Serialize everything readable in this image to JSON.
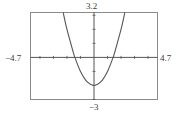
{
  "chart_data": {
    "type": "line",
    "title": "",
    "xlabel": "",
    "ylabel": "",
    "xlim": [
      -4.7,
      4.7
    ],
    "ylim": [
      -3,
      3.2
    ],
    "grid": false,
    "legend": null,
    "window_labels": {
      "xmin": "-4.7",
      "xmax": "4.7",
      "ymin": "-3",
      "ymax": "3.2"
    },
    "axis_ticks": {
      "x_step": 1,
      "y_step": 1
    },
    "series": [
      {
        "name": "y = x^2 - 2",
        "x": [
          -2.28,
          -2.0,
          -1.5,
          -1.414,
          -1.0,
          -0.5,
          0.0,
          0.5,
          1.0,
          1.414,
          1.5,
          2.0,
          2.28
        ],
        "values": [
          3.2,
          2.0,
          0.25,
          0.0,
          -1.0,
          -1.75,
          -2.0,
          -1.75,
          -1.0,
          0.0,
          0.25,
          2.0,
          3.2
        ]
      }
    ],
    "annotations": []
  },
  "colors": {
    "frame": "#8a8a8a",
    "axes": "#555555",
    "curve": "#555555",
    "text": "#3a3a3a"
  }
}
